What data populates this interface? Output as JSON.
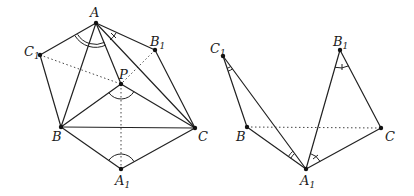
{
  "figure_left": {
    "labels": {
      "A": "A",
      "B1": "B",
      "C1": "C",
      "P": "P",
      "B": "B",
      "C": "C",
      "A1": "A",
      "sub1": "1"
    },
    "points": {
      "A": [
        96,
        23
      ],
      "B1": [
        155,
        50
      ],
      "C1": [
        40,
        55
      ],
      "P": [
        121,
        84
      ],
      "B": [
        61,
        127
      ],
      "C": [
        195,
        128
      ],
      "A1": [
        121,
        169
      ]
    }
  },
  "figure_right": {
    "labels": {
      "C1": "C",
      "B1": "B",
      "B": "B",
      "C": "C",
      "A1": "A",
      "sub1": "1"
    },
    "points": {
      "C1": [
        223,
        56
      ],
      "B1": [
        340,
        50
      ],
      "B": [
        247,
        127
      ],
      "C": [
        381,
        128
      ],
      "A1": [
        306,
        169
      ]
    }
  },
  "colors": {
    "ink": "#222222",
    "background": "#ffffff"
  }
}
